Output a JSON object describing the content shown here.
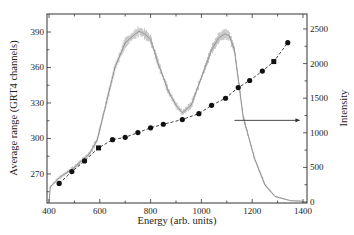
{
  "chart_data": {
    "type": "line",
    "title": "",
    "xlabel": "Energy  (arb. units)",
    "ylabel": "Average range  (GRT4 channels)",
    "y2label": "Intensity",
    "xlim": [
      395,
      1410
    ],
    "ylim": [
      247,
      405
    ],
    "y2lim": [
      0,
      2700
    ],
    "x_ticks": [
      400,
      600,
      800,
      1000,
      1200,
      1400
    ],
    "y_ticks": [
      270,
      300,
      330,
      360,
      390
    ],
    "y2_ticks": [
      0,
      500,
      1000,
      1500,
      2000,
      2500
    ],
    "grid": false,
    "legend": null,
    "series": [
      {
        "name": "Average range",
        "axis": "left",
        "style": "dashed line with filled circle markers",
        "x": [
          440,
          490,
          540,
          595,
          650,
          700,
          750,
          800,
          850,
          925,
          990,
          1040,
          1095,
          1145,
          1190,
          1240,
          1285,
          1340
        ],
        "values": [
          262,
          272,
          281,
          292,
          299,
          301,
          305,
          309,
          312,
          316,
          321,
          328,
          334,
          343,
          349,
          357,
          365,
          381
        ]
      },
      {
        "name": "Intensity",
        "axis": "right",
        "style": "noisy histogram line with error bars (grey)",
        "x": [
          400,
          405,
          440,
          500,
          560,
          590,
          620,
          660,
          700,
          730,
          755,
          780,
          800,
          830,
          870,
          900,
          925,
          960,
          1000,
          1040,
          1070,
          1093,
          1110,
          1130,
          1165,
          1210,
          1250,
          1290,
          1350,
          1400
        ],
        "values": [
          0,
          220,
          350,
          500,
          700,
          900,
          1350,
          1950,
          2300,
          2400,
          2470,
          2420,
          2350,
          2000,
          1600,
          1400,
          1290,
          1400,
          1800,
          2200,
          2380,
          2430,
          2400,
          2200,
          1220,
          620,
          250,
          80,
          20,
          10
        ]
      }
    ],
    "annotations": [
      {
        "type": "arrow",
        "text": "",
        "from": [
          1130,
          1180
        ],
        "to": [
          1390,
          1180
        ],
        "axis": "right",
        "meaning": "intensity curve refers to right axis"
      }
    ]
  },
  "colors": {
    "axis": "#333333",
    "range_series": "#111111",
    "intensity_series": "#8a8a8a"
  }
}
